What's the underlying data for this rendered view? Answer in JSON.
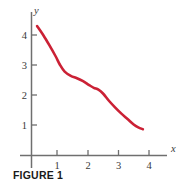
{
  "caption": "FIGURE 1",
  "chart_data": {
    "type": "line",
    "title": "",
    "subtitle": "",
    "xlabel": "x",
    "ylabel": "y",
    "grid": false,
    "legend": null,
    "xlim": [
      0,
      4.5
    ],
    "ylim": [
      0,
      4.6
    ],
    "xticks": [
      1,
      2,
      3,
      4
    ],
    "xtick_labels": [
      "1",
      "2",
      "3",
      "4"
    ],
    "yticks": [
      1,
      2,
      3,
      4
    ],
    "ytick_labels": [
      "1",
      "2",
      "3",
      "4"
    ],
    "series": [
      {
        "name": "curve",
        "color": "#CB2135",
        "linewidth": 2.6,
        "x": [
          0.35,
          0.55,
          0.75,
          0.95,
          1.1,
          1.25,
          1.45,
          1.65,
          1.85,
          2.05,
          2.2,
          2.35,
          2.5,
          2.7,
          2.9,
          3.1,
          3.3,
          3.5,
          3.65,
          3.8
        ],
        "y": [
          4.3,
          4.0,
          3.66,
          3.3,
          3.0,
          2.78,
          2.64,
          2.56,
          2.46,
          2.33,
          2.24,
          2.18,
          2.05,
          1.8,
          1.58,
          1.38,
          1.2,
          1.02,
          0.92,
          0.86
        ]
      }
    ],
    "axis_color": "#6F6F6F",
    "background": "#FFFFFF"
  },
  "axes": {
    "y_axis_name": "y",
    "x_axis_name": "x"
  }
}
